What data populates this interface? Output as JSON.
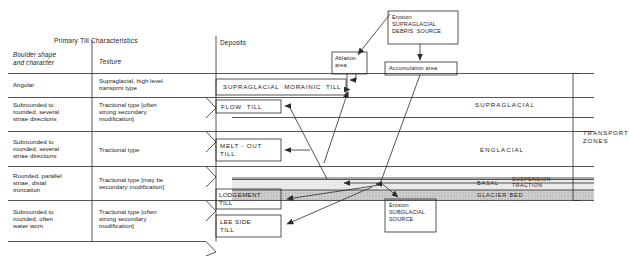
{
  "figure": {
    "headers": {
      "primary_group": "Primary Till Characteristics",
      "col_boulder": "Boulder shape\nand character",
      "col_texture": "Texture",
      "col_deposits": "Deposits"
    },
    "rows": [
      {
        "boulder": "Angular",
        "texture": "Supraglacial, high level\ntransprnt type",
        "deposit": "SUPRAGLACIAL  MORAINIC  TILL"
      },
      {
        "boulder": "Subrounded to\nrounded, several\nstriae directions",
        "texture": "Tractional type [often\nstrong secondary\nmodification]",
        "deposit": "FLOW  TILL"
      },
      {
        "boulder": "Subrounded to\nrounded, several\nstriae directions",
        "texture": "Tractional type",
        "deposit": "MELT - OUT\nTILL"
      },
      {
        "boulder": "Rounded, parallel\nstriae, distal\ntruncation",
        "texture": "Tractional type [may be\nsecondary modification]",
        "deposit": "LODGEMENT\nTILL"
      },
      {
        "boulder": "Subrounded to\nrounded, often\nwater worn",
        "texture": "Tractional type [often\nstrong secondary\nmodification]",
        "deposit": "LEE SIDE\nTILL"
      }
    ],
    "source_boxes": [
      {
        "id": "supraglacial-source",
        "text": "Erosion\nSUPRAGLACIAL\nDEBRIS  SOURCE"
      },
      {
        "id": "ablation-area",
        "text": "Ablation\narea"
      },
      {
        "id": "accumulation-area",
        "text": "Accumulation area"
      },
      {
        "id": "subglacial-source",
        "text": "Erosion\nSUBGLACIAL\nSOURCE"
      }
    ],
    "zones": {
      "title": "TRANSPORT\nZONES",
      "items": [
        {
          "id": "supraglacial",
          "label": "SUPRAGLACIAL"
        },
        {
          "id": "englacial",
          "label": "ENGLACIAL"
        },
        {
          "id": "basal",
          "label": "BASAL"
        },
        {
          "id": "suspension",
          "label": "SUSPENSION"
        },
        {
          "id": "traction",
          "label": "TRACTION"
        },
        {
          "id": "glacier-bed",
          "label": "GLACIER BED"
        }
      ]
    },
    "colors": {
      "line": "#2b2b2b",
      "background": "#ffffff",
      "basal_fill": "#e8e8e8",
      "bed_fill": "#c9c9c9",
      "text": "#1b1b1b"
    }
  }
}
